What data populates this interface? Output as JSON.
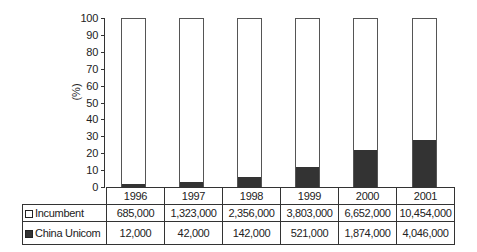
{
  "chart_data": {
    "type": "bar",
    "stacked": true,
    "percent_stacked": true,
    "title": "",
    "xlabel": "",
    "ylabel": "(%)",
    "ylim": [
      0,
      100
    ],
    "yticks": [
      0,
      10,
      20,
      30,
      40,
      50,
      60,
      70,
      80,
      90,
      100
    ],
    "grid": false,
    "legend_position": "table-below",
    "categories": [
      "1996",
      "1997",
      "1998",
      "1999",
      "2000",
      "2001"
    ],
    "series": [
      {
        "name": "Incumbent",
        "fill": "#ffffff",
        "values": [
          685000,
          1323000,
          2356000,
          3803000,
          6652000,
          10454000
        ],
        "labels": [
          "685,000",
          "1,323,000",
          "2,356,000",
          "3,803,000",
          "6,652,000",
          "10,454,000"
        ],
        "percent": [
          98.3,
          96.9,
          94.3,
          88.0,
          78.0,
          72.1
        ]
      },
      {
        "name": "China Unicom",
        "fill": "#333333",
        "values": [
          12000,
          42000,
          142000,
          521000,
          1874000,
          4046000
        ],
        "labels": [
          "12,000",
          "42,000",
          "142,000",
          "521,000",
          "1,874,000",
          "4,046,000"
        ],
        "percent": [
          1.7,
          3.1,
          5.7,
          12.0,
          22.0,
          27.9
        ]
      }
    ]
  },
  "axis": {
    "unit": "(%)",
    "ticks": [
      "0",
      "10",
      "20",
      "30",
      "40",
      "50",
      "60",
      "70",
      "80",
      "90",
      "100"
    ]
  },
  "table": {
    "years": [
      "1996",
      "1997",
      "1998",
      "1999",
      "2000",
      "2001"
    ],
    "rows": [
      {
        "label": "Incumbent",
        "cells": [
          "685,000",
          "1,323,000",
          "2,356,000",
          "3,803,000",
          "6,652,000",
          "10,454,000"
        ]
      },
      {
        "label": "China Unicom",
        "cells": [
          "12,000",
          "42,000",
          "142,000",
          "521,000",
          "1,874,000",
          "4,046,000"
        ]
      }
    ]
  }
}
